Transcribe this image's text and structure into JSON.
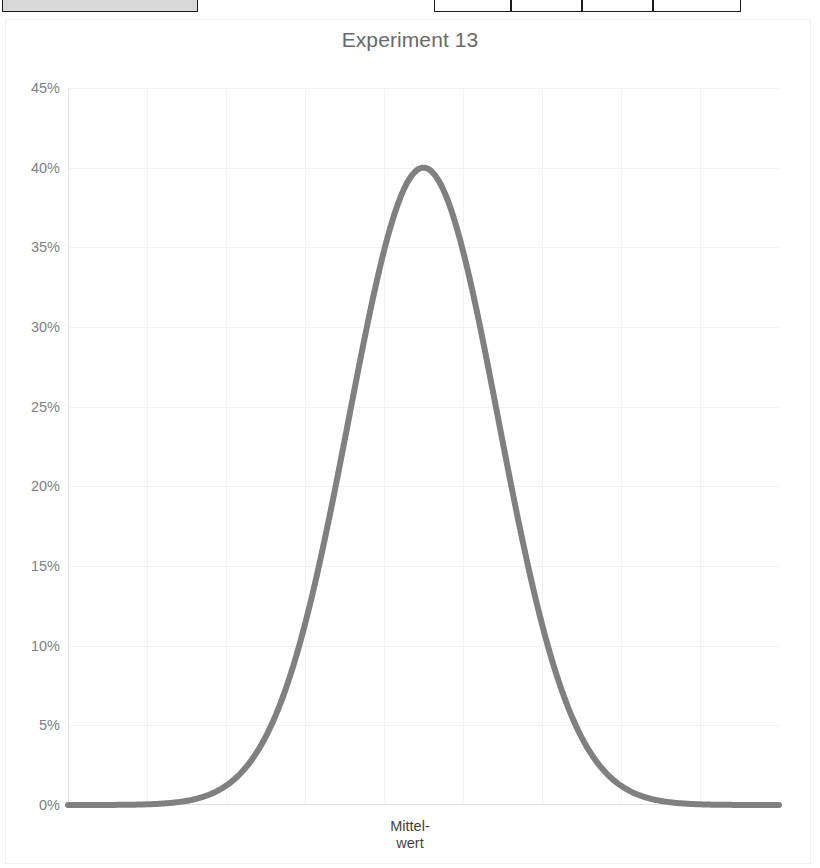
{
  "top_fragments": {
    "description": "cropped spreadsheet cells visible at very top of screenshot",
    "cells": [
      {
        "name": "header-cell-left",
        "x": 2,
        "width": 196,
        "filled": true
      },
      {
        "name": "table-cell-1",
        "x": 434,
        "width": 77,
        "filled": false
      },
      {
        "name": "table-cell-2",
        "x": 511,
        "width": 71,
        "filled": false
      },
      {
        "name": "table-cell-3",
        "x": 582,
        "width": 71,
        "filled": false
      },
      {
        "name": "table-cell-4",
        "x": 653,
        "width": 88,
        "filled": false
      }
    ]
  },
  "chart_data": {
    "type": "line",
    "title": "Experiment 13",
    "xlabel": "Mittel-\nwert",
    "xlabel_line1": "Mittel-",
    "xlabel_line2": "wert",
    "ylabel": "",
    "ylim": [
      0,
      45
    ],
    "ytick_labels": [
      "45%",
      "40%",
      "35%",
      "30%",
      "25%",
      "20%",
      "15%",
      "10%",
      "5%",
      "0%"
    ],
    "ytick_values": [
      45,
      40,
      35,
      30,
      25,
      20,
      15,
      10,
      5,
      0
    ],
    "xtick_labels": [],
    "grid": true,
    "grid_color": "#f2f2f2",
    "legend": null,
    "series": [
      {
        "name": "Normalverteilung",
        "color": "#808080",
        "line_width": 6,
        "distribution": "gaussian",
        "peak_value": 40,
        "mean_x_fraction": 0.5,
        "sigma_x_fraction": 0.105,
        "x": [
          0.0,
          0.025,
          0.05,
          0.075,
          0.1,
          0.125,
          0.15,
          0.175,
          0.2,
          0.225,
          0.25,
          0.275,
          0.3,
          0.325,
          0.35,
          0.375,
          0.4,
          0.425,
          0.45,
          0.475,
          0.5,
          0.525,
          0.55,
          0.575,
          0.6,
          0.625,
          0.65,
          0.675,
          0.7,
          0.725,
          0.75,
          0.775,
          0.8,
          0.825,
          0.85,
          0.875,
          0.9,
          0.925,
          0.95,
          0.975,
          1.0
        ],
        "values": [
          0.03,
          0.06,
          0.11,
          0.21,
          0.38,
          0.67,
          1.14,
          1.86,
          2.94,
          4.46,
          6.51,
          9.13,
          12.32,
          15.98,
          19.93,
          23.88,
          27.53,
          30.58,
          32.8,
          34.06,
          34.3,
          34.06,
          32.8,
          30.58,
          27.53,
          23.88,
          19.93,
          15.98,
          12.32,
          9.13,
          6.51,
          4.46,
          2.94,
          1.86,
          1.14,
          0.67,
          0.38,
          0.21,
          0.11,
          0.06,
          0.03
        ]
      }
    ],
    "peak_label": "40%",
    "plot_area_px": {
      "left": 68,
      "top": 88,
      "width": 711,
      "height": 717
    },
    "vertical_gridline_count": 9
  }
}
